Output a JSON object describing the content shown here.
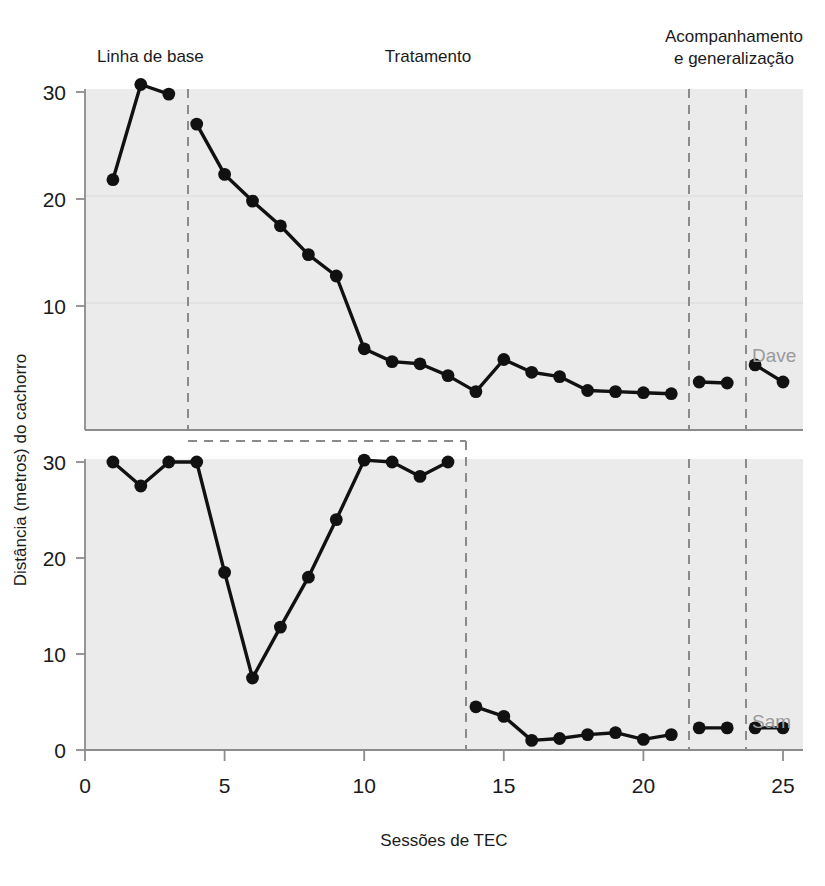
{
  "figure": {
    "background_color": "#ffffff",
    "panel_fill": "#ebebeb",
    "axis_color": "#8c8c8c",
    "marker_color": "#111111",
    "divider_color": "#8a8a8a",
    "series_label_color": "#9a9a9a"
  },
  "phase_headers": [
    {
      "id": "baseline",
      "label": "Linha de base"
    },
    {
      "id": "treatment",
      "label": "Tratamento"
    },
    {
      "id": "followup",
      "label": "Acompanhamento",
      "label2": "e generalização"
    }
  ],
  "axes": {
    "xlabel": "Sessões de TEC",
    "ylabel": "Distância (metros) do cachorro",
    "xticks": [
      "0",
      "5",
      "10",
      "15",
      "20",
      "25"
    ],
    "xtick_values": [
      0,
      5,
      10,
      15,
      20,
      25
    ],
    "xlim": [
      0,
      25
    ],
    "top_yticks": [
      "10",
      "20",
      "30"
    ],
    "top_ytick_values": [
      10,
      20,
      30
    ],
    "top_ylim": [
      0,
      32
    ],
    "bottom_yticks": [
      "0",
      "10",
      "20",
      "30"
    ],
    "bottom_ytick_values": [
      0,
      10,
      20,
      30
    ],
    "bottom_ylim": [
      0,
      32
    ]
  },
  "chart_data": {
    "type": "line",
    "title": "",
    "subtitle": "",
    "xlabel": "Sessões de TEC",
    "ylabel": "Distância (metros) do cachorro",
    "xlim": [
      0,
      25
    ],
    "grid": false,
    "legend_position": "inline-right",
    "panels": [
      {
        "name": "Dave",
        "label": "Dave",
        "ylim": [
          0,
          32
        ],
        "yticks": [
          10,
          20,
          30
        ],
        "phase_dividers": [
          3.7,
          21.6,
          23.6
        ],
        "segments": [
          {
            "phase": "Linha de base",
            "x": [
              1,
              2,
              3
            ],
            "y": [
              21.8,
              30.7,
              29.8
            ]
          },
          {
            "phase": "Tratamento",
            "x": [
              4,
              5,
              6,
              7,
              8,
              9,
              10,
              11,
              12,
              13,
              14,
              15,
              16,
              17,
              18,
              19,
              20,
              21
            ],
            "y": [
              27.0,
              22.3,
              19.8,
              17.5,
              14.8,
              12.8,
              6.0,
              4.8,
              4.6,
              3.5,
              2.0,
              5.0,
              3.8,
              3.4,
              2.1,
              2.0,
              1.9,
              1.8
            ]
          },
          {
            "phase": "Acompanhamento",
            "x": [
              22,
              23
            ],
            "y": [
              2.9,
              2.8
            ]
          },
          {
            "phase": "Generalização",
            "x": [
              24,
              25
            ],
            "y": [
              4.5,
              2.9
            ]
          }
        ]
      },
      {
        "name": "Sam",
        "label": "Sam",
        "ylim": [
          0,
          32
        ],
        "yticks": [
          0,
          10,
          20,
          30
        ],
        "phase_dividers": [
          13.6,
          21.6,
          23.6
        ],
        "segments": [
          {
            "phase": "Linha de base",
            "x": [
              1,
              2,
              3,
              4,
              5,
              6,
              7,
              8,
              9,
              10,
              11,
              12,
              13
            ],
            "y": [
              30.0,
              27.5,
              30.0,
              30.0,
              18.5,
              7.5,
              12.8,
              18.0,
              24.0,
              30.2,
              30.0,
              28.5,
              30.0
            ]
          },
          {
            "phase": "Tratamento",
            "x": [
              14,
              15,
              16,
              17,
              18,
              19,
              20,
              21
            ],
            "y": [
              4.5,
              3.5,
              1.0,
              1.2,
              1.6,
              1.8,
              1.1,
              1.6
            ]
          },
          {
            "phase": "Acompanhamento",
            "x": [
              22,
              23
            ],
            "y": [
              2.3,
              2.3
            ]
          },
          {
            "phase": "Generalização",
            "x": [
              24,
              25
            ],
            "y": [
              2.3,
              2.3
            ]
          }
        ]
      }
    ]
  },
  "series_labels": [
    {
      "id": "dave",
      "text": "Dave"
    },
    {
      "id": "sam",
      "text": "Sam"
    }
  ]
}
